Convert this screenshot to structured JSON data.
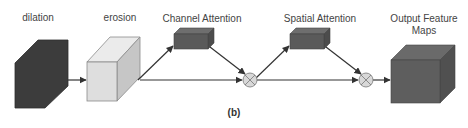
{
  "diagram": {
    "caption": "(b)",
    "nodes": {
      "dilation": {
        "label": "dilation",
        "color_front": "#3c3c3c",
        "color_top": "#464646",
        "color_side": "#333333"
      },
      "erosion": {
        "label": "erosion",
        "color_front": "#dedede",
        "color_top": "#ebebeb",
        "color_side": "#c6c6c6"
      },
      "channel_attention": {
        "label": "Channel Attention",
        "color_front": "#5a5a5a",
        "color_top": "#6e6e6e",
        "color_side": "#4c4c4c"
      },
      "spatial_attention": {
        "label": "Spatial Attention",
        "color_front": "#5a5a5a",
        "color_top": "#6e6e6e",
        "color_side": "#4c4c4c"
      },
      "output": {
        "label_line1": "Output Feature",
        "label_line2": "Maps",
        "color_front": "#5e5e5e",
        "color_top": "#6a6a6a",
        "color_side": "#505050"
      }
    },
    "operators": [
      {
        "id": "multiply-1",
        "symbol": "⊗",
        "fill": "#d8d8d8"
      },
      {
        "id": "multiply-2",
        "symbol": "⊗",
        "fill": "#d8d8d8"
      }
    ],
    "edges": [
      {
        "from": "dilation",
        "to": "erosion"
      },
      {
        "from": "erosion",
        "to": "channel_attention"
      },
      {
        "from": "erosion",
        "to": "multiply-1"
      },
      {
        "from": "channel_attention",
        "to": "multiply-1"
      },
      {
        "from": "multiply-1",
        "to": "spatial_attention"
      },
      {
        "from": "multiply-1",
        "to": "multiply-2"
      },
      {
        "from": "spatial_attention",
        "to": "multiply-2"
      },
      {
        "from": "multiply-2",
        "to": "output"
      }
    ],
    "edge_color": "#333333"
  }
}
